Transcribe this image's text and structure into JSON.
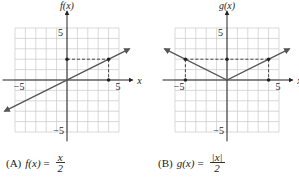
{
  "chart_data": [
    {
      "type": "line",
      "panel": "A",
      "title": "(A) f(x) = x/2",
      "function": "f(x) = x/2",
      "xlabel": "x",
      "ylabel": "f(x)",
      "xlim": [
        -5,
        5
      ],
      "ylim": [
        -5,
        5
      ],
      "grid": true,
      "tick_labels": {
        "x": [
          "-5",
          "5"
        ],
        "y": [
          "5",
          "-5"
        ]
      },
      "series": [
        {
          "name": "f(x)",
          "x": [
            -6,
            6
          ],
          "y": [
            -3,
            3
          ]
        }
      ],
      "marked_points": [
        {
          "x": 4,
          "y": 2
        },
        {
          "x": 0,
          "y": 2
        },
        {
          "x": 4,
          "y": 0
        }
      ],
      "dashed_guides": [
        {
          "from": [
            0,
            2
          ],
          "to": [
            4,
            2
          ]
        },
        {
          "from": [
            4,
            2
          ],
          "to": [
            4,
            0
          ]
        }
      ]
    },
    {
      "type": "line",
      "panel": "B",
      "title": "(B) g(x) = |x|/2",
      "function": "g(x) = |x|/2",
      "xlabel": "x",
      "ylabel": "g(x)",
      "xlim": [
        -5,
        5
      ],
      "ylim": [
        -5,
        5
      ],
      "grid": true,
      "tick_labels": {
        "x": [
          "-5",
          "5"
        ],
        "y": [
          "5",
          "-5"
        ]
      },
      "series": [
        {
          "name": "g(x)",
          "x": [
            -6,
            0,
            6
          ],
          "y": [
            3,
            0,
            3
          ]
        }
      ],
      "marked_points": [
        {
          "x": -4,
          "y": 2
        },
        {
          "x": 0,
          "y": 2
        },
        {
          "x": 4,
          "y": 2
        },
        {
          "x": -4,
          "y": 0
        },
        {
          "x": 4,
          "y": 0
        }
      ],
      "dashed_guides": [
        {
          "from": [
            -4,
            2
          ],
          "to": [
            4,
            2
          ]
        },
        {
          "from": [
            -4,
            2
          ],
          "to": [
            -4,
            0
          ]
        },
        {
          "from": [
            4,
            2
          ],
          "to": [
            4,
            0
          ]
        }
      ]
    }
  ],
  "captions": {
    "a": {
      "label": "(A)",
      "fn": "f(x)",
      "eq": "=",
      "num": "x",
      "den": "2"
    },
    "b": {
      "label": "(B)",
      "fn": "g(x)",
      "eq": "=",
      "num": "|x|",
      "den": "2"
    }
  },
  "axis_labels": {
    "a": {
      "y": "f(x)",
      "x": "x",
      "xneg": "−5",
      "xpos": "5",
      "ypos": "5",
      "yneg": "−5"
    },
    "b": {
      "y": "g(x)",
      "x": "x",
      "xneg": "−5",
      "xpos": "5",
      "ypos": "5",
      "yneg": "−5"
    }
  },
  "colors": {
    "grid": "#c8c8c8",
    "axis": "#222222",
    "curve": "#555555",
    "guide": "#333333",
    "text": "#222222"
  }
}
